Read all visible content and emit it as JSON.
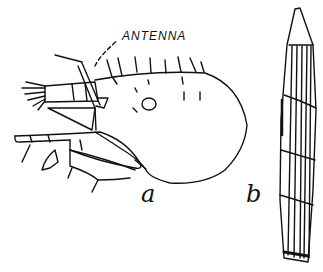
{
  "figure": {
    "annotation": "ANTENNA",
    "panels": [
      {
        "id": "a",
        "label": "a",
        "subject": "insect head, lateral view"
      },
      {
        "id": "b",
        "label": "b",
        "subject": "elongated segmented structure"
      }
    ],
    "colors": {
      "ink": "#111111",
      "background": "#ffffff"
    }
  }
}
